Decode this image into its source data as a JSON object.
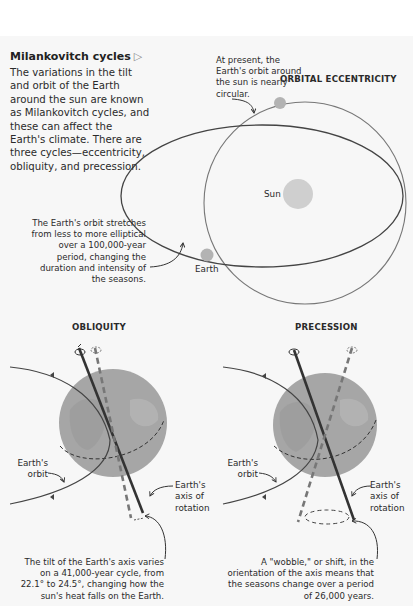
{
  "title": "Milankovitch cycles",
  "title_icon": "triangle-right-outline-icon",
  "intro": "The variations in the tilt and orbit of the Earth around the sun are known as Milankovitch cycles, and these can affect the Earth's climate. There are three cycles—eccentricity, obliquity, and precession.",
  "eccentricity": {
    "heading": "ORBITAL ECCENTRICITY",
    "present_note": "At present, the Earth's orbit around the sun is nearly circular.",
    "stretch_note": "The Earth's orbit stretches from less to more elliptical over a 100,000-year period, changing the duration and intensity of the seasons.",
    "sun_label": "Sun",
    "earth_label": "Earth"
  },
  "obliquity": {
    "heading": "OBLIQUITY",
    "orbit_label": "Earth's orbit",
    "axis_label": "Earth's axis of rotation",
    "note": "The tilt of the Earth's axis varies on a 41,000-year cycle, from 22.1° to 24.5°, changing how the sun's heat falls on the Earth."
  },
  "precession": {
    "heading": "PRECESSION",
    "orbit_label": "Earth's orbit",
    "axis_label": "Earth's axis of rotation",
    "note": "A \"wobble,\" or shift, in the orientation of the axis means that the seasons change over a period of 26,000 years."
  },
  "colors": {
    "background": "#f7f7f7",
    "line": "#4a4a4a",
    "sun": "#cfcfcf",
    "globe": "#a6a6a6",
    "text": "#2a2a2a"
  }
}
